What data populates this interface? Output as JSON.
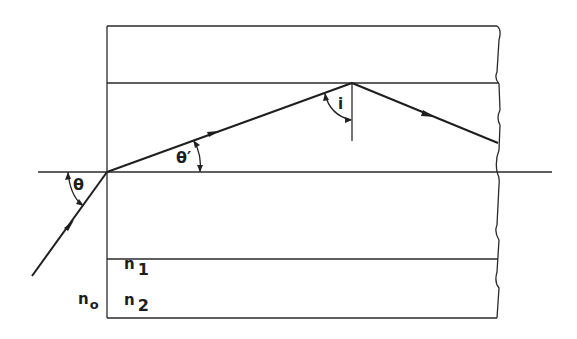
{
  "diagram": {
    "type": "optical fiber / waveguide ray diagram",
    "labels": {
      "theta": "θ",
      "theta_prime": "θ′",
      "incidence_angle": "i",
      "n1_base": "n",
      "n1_sub": "1",
      "n2_base": "n",
      "n2_sub": "2",
      "n0_base": "n",
      "n0_sub": "o"
    },
    "regions": [
      "cladding (top)",
      "core (n1)",
      "cladding (n2)",
      "outside medium (n0)"
    ],
    "colors": {
      "line": "#2a2a2a",
      "background": "#ffffff"
    }
  }
}
